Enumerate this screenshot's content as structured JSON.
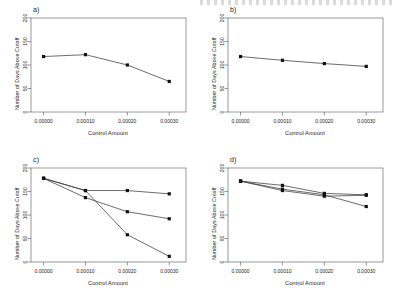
{
  "figure": {
    "background": "#ffffff",
    "axis_color": "#555555",
    "line_color": "#3a3a3a",
    "point_color": "#111111"
  },
  "chart_data": [
    {
      "type": "line",
      "panel": "a)",
      "title": "",
      "xlabel": "Control Amount",
      "ylabel": "Number of Days Above Cutoff",
      "x": [
        0.0,
        0.0001,
        0.0002,
        0.0003
      ],
      "xticklabels": [
        "0.00000",
        "0.00010",
        "0.00020",
        "0.00030"
      ],
      "yticklabels": [
        "0",
        "50",
        "100",
        "150",
        "200"
      ],
      "yticks": [
        0,
        50,
        100,
        150,
        200
      ],
      "xlim": [
        -3e-05,
        0.00034
      ],
      "ylim": [
        0,
        200
      ],
      "grid": false,
      "legend": "none",
      "series": [
        {
          "name": "series-1",
          "values": [
            118,
            122,
            100,
            65
          ]
        }
      ]
    },
    {
      "type": "line",
      "panel": "b)",
      "title": "",
      "xlabel": "Control Amount",
      "ylabel": "Number of Days Above Cutoff",
      "x": [
        0.0,
        0.0001,
        0.0002,
        0.0003
      ],
      "xticklabels": [
        "0.00000",
        "0.00010",
        "0.00020",
        "0.00030"
      ],
      "yticklabels": [
        "0",
        "50",
        "100",
        "150",
        "200"
      ],
      "yticks": [
        0,
        50,
        100,
        150,
        200
      ],
      "xlim": [
        -3e-05,
        0.00034
      ],
      "ylim": [
        0,
        200
      ],
      "grid": false,
      "legend": "none",
      "series": [
        {
          "name": "series-1",
          "values": [
            118,
            110,
            103,
            97
          ]
        }
      ]
    },
    {
      "type": "line",
      "panel": "c)",
      "title": "",
      "xlabel": "Control Amount",
      "ylabel": "Number of Days Above Cutoff",
      "x": [
        0.0,
        0.0001,
        0.0002,
        0.0003
      ],
      "xticklabels": [
        "0.00000",
        "0.00010",
        "0.00020",
        "0.00030"
      ],
      "yticklabels": [
        "0",
        "50",
        "100",
        "150",
        "200"
      ],
      "yticks": [
        0,
        50,
        100,
        150,
        200
      ],
      "xlim": [
        -3e-05,
        0.00034
      ],
      "ylim": [
        0,
        200
      ],
      "grid": false,
      "legend": "none",
      "series": [
        {
          "name": "series-1",
          "values": [
            178,
            152,
            152,
            145
          ]
        },
        {
          "name": "series-2",
          "values": [
            178,
            137,
            107,
            92
          ]
        },
        {
          "name": "series-3",
          "values": [
            178,
            152,
            58,
            12
          ]
        }
      ]
    },
    {
      "type": "line",
      "panel": "d)",
      "title": "",
      "xlabel": "Control Amount",
      "ylabel": "Number of Days Above Cutoff",
      "x": [
        0.0,
        0.0001,
        0.0002,
        0.0003
      ],
      "xticklabels": [
        "0.00000",
        "0.00010",
        "0.00020",
        "0.00030"
      ],
      "yticklabels": [
        "0",
        "50",
        "100",
        "150",
        "200"
      ],
      "yticks": [
        0,
        50,
        100,
        150,
        200
      ],
      "xlim": [
        -3e-05,
        0.00034
      ],
      "ylim": [
        0,
        200
      ],
      "grid": false,
      "legend": "none",
      "series": [
        {
          "name": "series-1",
          "values": [
            172,
            163,
            146,
            143
          ]
        },
        {
          "name": "series-2",
          "values": [
            172,
            152,
            140,
            142
          ]
        },
        {
          "name": "series-3",
          "values": [
            172,
            155,
            143,
            118
          ]
        }
      ]
    }
  ]
}
